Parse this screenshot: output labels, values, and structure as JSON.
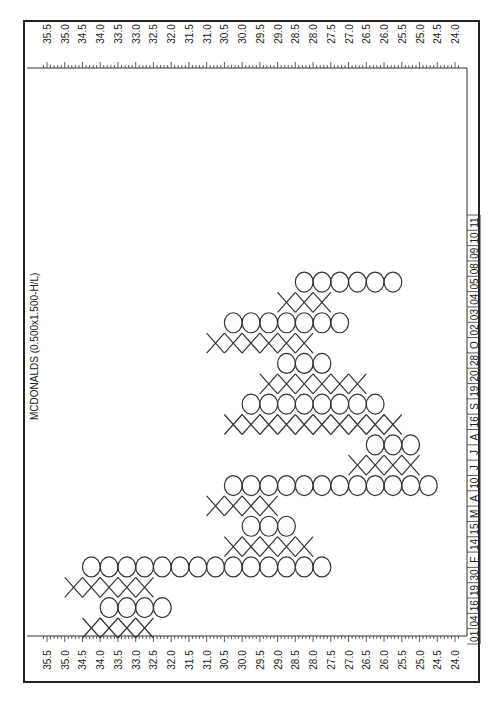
{
  "chart_data": {
    "type": "point-and-figure",
    "title": "MCDONALDS (0.500x1.500-H/L)",
    "orientation": "rotated-90-clockwise",
    "box_size": 0.5,
    "reversal": 1.5,
    "price_range": [
      24.0,
      35.5
    ],
    "price_ticks": [
      "35.5",
      "35.0",
      "34.5",
      "34.0",
      "33.5",
      "33.0",
      "32.5",
      "32.0",
      "31.5",
      "31.0",
      "30.5",
      "30.0",
      "29.5",
      "29.0",
      "28.5",
      "28.0",
      "27.5",
      "27.0",
      "26.5",
      "26.0",
      "25.5",
      "25.0",
      "24.5",
      "24.0"
    ],
    "date_labels": [
      "01",
      "04",
      "16",
      "19",
      "30",
      "F",
      "14",
      "15",
      "M",
      "A",
      "10",
      "J",
      "J",
      "A",
      "16",
      "S",
      "19",
      "20",
      "28",
      "O",
      "02",
      "03",
      "04",
      "05",
      "08",
      "09",
      "10",
      "11"
    ],
    "columns": [
      {
        "type": "X",
        "high": 34.5,
        "low": 32.5
      },
      {
        "type": "O",
        "high": 34.0,
        "low": 32.0
      },
      {
        "type": "X",
        "high": 35.0,
        "low": 32.5
      },
      {
        "type": "O",
        "high": 34.5,
        "low": 27.5
      },
      {
        "type": "X",
        "high": 30.5,
        "low": 28.0
      },
      {
        "type": "O",
        "high": 30.0,
        "low": 28.5
      },
      {
        "type": "X",
        "high": 31.0,
        "low": 29.0
      },
      {
        "type": "O",
        "high": 30.5,
        "low": 24.5
      },
      {
        "type": "X",
        "high": 27.0,
        "low": 25.0
      },
      {
        "type": "O",
        "high": 26.5,
        "low": 25.0
      },
      {
        "type": "X",
        "high": 30.5,
        "low": 25.5
      },
      {
        "type": "O",
        "high": 30.0,
        "low": 26.0
      },
      {
        "type": "X",
        "high": 29.5,
        "low": 26.5
      },
      {
        "type": "O",
        "high": 29.0,
        "low": 27.5
      },
      {
        "type": "X",
        "high": 31.0,
        "low": 28.0
      },
      {
        "type": "O",
        "high": 30.5,
        "low": 27.0
      },
      {
        "type": "X",
        "high": 29.0,
        "low": 27.5
      },
      {
        "type": "O",
        "high": 28.5,
        "low": 25.5
      }
    ]
  }
}
